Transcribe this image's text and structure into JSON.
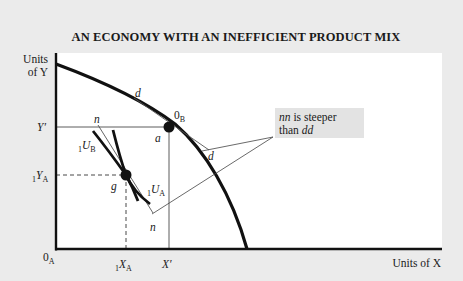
{
  "title": "AN ECONOMY WITH AN INEFFICIENT PRODUCT MIX",
  "colors": {
    "background": "#ebebeb",
    "panel": "#ffffff",
    "ink": "#1a1a1a",
    "callout_bg": "#e3e3e3"
  },
  "axes": {
    "y_label_line1": "Units",
    "y_label_line2": "of Y",
    "x_label": "Units of X",
    "origin_main": "0",
    "origin_sub": "A"
  },
  "ticks": {
    "y_prime": "Y′",
    "y_a_pre": "1",
    "y_a_main": "Y",
    "y_a_sub": "A",
    "x_a_pre": "1",
    "x_a_main": "X",
    "x_a_sub": "A",
    "x_prime": "X′"
  },
  "points": {
    "ob_main": "0",
    "ob_sub": "B",
    "a": "a",
    "g": "g"
  },
  "curves": {
    "ub_pre": "1",
    "ub_main": "U",
    "ub_sub": "B",
    "ua_pre": "1",
    "ua_main": "U",
    "ua_sub": "A",
    "n_top": "n",
    "n_bottom": "n",
    "d_top": "d",
    "d_bottom": "d"
  },
  "callout": {
    "line1_ital": "nn",
    "line1_rest": " is steeper",
    "line2_rest": "than ",
    "line2_ital": "dd"
  }
}
